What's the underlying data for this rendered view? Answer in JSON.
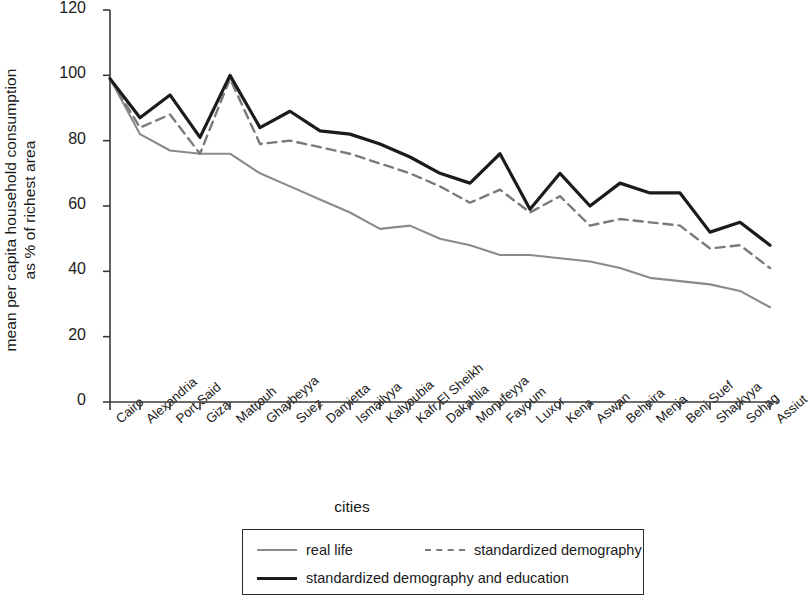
{
  "chart_data": {
    "type": "line",
    "title": "",
    "xlabel": "cities",
    "ylabel": "mean per capita household consumption\nas % of richest area",
    "ylim": [
      0,
      120
    ],
    "yticks": [
      0,
      20,
      40,
      60,
      80,
      100,
      120
    ],
    "grid": false,
    "legend_position": "bottom",
    "categories": [
      "Cairo",
      "Alexandria",
      "Port Said",
      "Giza",
      "Matrouh",
      "Gharbeyya",
      "Suez",
      "Damietta",
      "Ismailyya",
      "Kalyoubia",
      "Kafr El Sheikh",
      "Dakahlia",
      "Monufeyya",
      "Fayoum",
      "Luxor",
      "Kena",
      "Aswan",
      "Beheira",
      "Menia",
      "Beni Suef",
      "Sharkyya",
      "Sohag",
      "Assiut"
    ],
    "series": [
      {
        "name": "real life",
        "color": "#8a8a8a",
        "style": "solid",
        "width": 2.1,
        "values": [
          99,
          82,
          77,
          76,
          76,
          70,
          66,
          62,
          58,
          53,
          54,
          50,
          48,
          45,
          45,
          44,
          43,
          41,
          38,
          37,
          36,
          34,
          29
        ]
      },
      {
        "name": "standardized demography",
        "color": "#7a7a7a",
        "style": "dashed",
        "width": 2.4,
        "values": [
          99,
          84,
          88,
          76,
          99,
          79,
          80,
          78,
          76,
          73,
          70,
          66,
          61,
          65,
          58,
          63,
          54,
          56,
          55,
          54,
          47,
          48,
          41
        ]
      },
      {
        "name": "standardized demography and education",
        "color": "#1b1b1b",
        "style": "solid",
        "width": 3.2,
        "values": [
          99,
          87,
          94,
          81,
          100,
          84,
          89,
          83,
          82,
          79,
          75,
          70,
          67,
          76,
          59,
          70,
          60,
          67,
          64,
          64,
          52,
          55,
          48
        ]
      }
    ]
  },
  "axes": {
    "y_tick_labels": [
      "0",
      "20",
      "40",
      "60",
      "80",
      "100",
      "120"
    ]
  },
  "legend": {
    "entries": [
      {
        "label": "real life",
        "swatch": "solid-gray"
      },
      {
        "label": "standardized demography",
        "swatch": "dashed"
      },
      {
        "label": "standardized demography and education",
        "swatch": "solid-dark"
      }
    ]
  }
}
